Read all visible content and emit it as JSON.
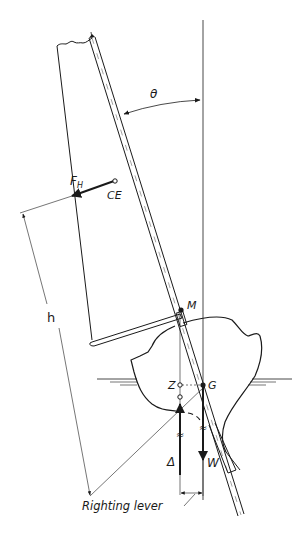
{
  "diagram": {
    "labels": {
      "theta": "θ",
      "force": "F",
      "force_sub": "H",
      "ce": "CE",
      "h": "h",
      "m": "M",
      "z": "Z",
      "g": "G",
      "delta": "Δ",
      "w": "W",
      "righting_lever": "Righting lever"
    },
    "colors": {
      "ink": "#1a1a1a",
      "background": "#ffffff"
    }
  }
}
